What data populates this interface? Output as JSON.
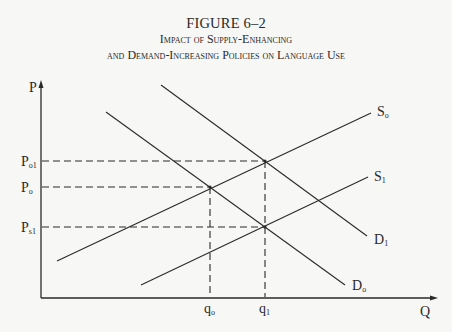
{
  "figure": {
    "number": "FIGURE 6–2",
    "title_line1": "Impact of Supply-Enhancing",
    "title_line2": "and Demand-Increasing Policies on Language Use"
  },
  "axes": {
    "y_label": "P",
    "x_label": "Q"
  },
  "curves": {
    "S0": {
      "label": "S",
      "sub": "o"
    },
    "S1": {
      "label": "S",
      "sub": "1"
    },
    "D0": {
      "label": "D",
      "sub": "o"
    },
    "D1": {
      "label": "D",
      "sub": "1"
    }
  },
  "price_ticks": [
    {
      "label": "P",
      "sub": "o1"
    },
    {
      "label": "P",
      "sub": "o"
    },
    {
      "label": "P",
      "sub": "s1"
    }
  ],
  "quantity_ticks": [
    {
      "label": "q",
      "sub": "o"
    },
    {
      "label": "q",
      "sub": "1"
    }
  ],
  "colors": {
    "line": "#2a2a2a",
    "background": "#f7f7f5"
  }
}
